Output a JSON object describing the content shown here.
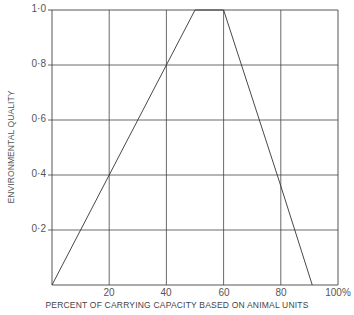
{
  "chart_data": {
    "type": "line",
    "title": "",
    "xlabel": "PERCENT OF CARRYING  CAPACITY BASED ON ANIMAL UNITS",
    "ylabel": "ENVIRONMENTAL QUALITY",
    "xlim": [
      0,
      100
    ],
    "ylim": [
      0,
      1.0
    ],
    "grid": true,
    "legend": null,
    "x_ticks": [
      "20",
      "40",
      "60",
      "80",
      "100%"
    ],
    "y_ticks": [
      "0·2",
      "0·4",
      "0·6",
      "0·8",
      "1·0"
    ],
    "series": [
      {
        "name": "Environmental quality",
        "x": [
          0,
          20,
          40,
          50,
          60,
          80,
          91
        ],
        "y": [
          0,
          0.4,
          0.8,
          1.0,
          1.0,
          0.36,
          0
        ]
      }
    ]
  },
  "colors": {
    "line": "#333333",
    "grid": "#444444",
    "text": "#555555"
  }
}
